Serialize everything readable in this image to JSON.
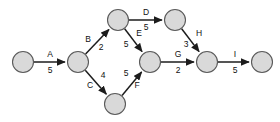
{
  "diagram": {
    "background_color": "#ffffff",
    "node_fill": "#d9d9d9",
    "node_stroke": "#5a5a5a",
    "edge_color": "#1c1c1c",
    "node_radius": 10.5,
    "nodes": [
      {
        "id": "n1",
        "cx": 23,
        "cy": 62,
        "label": ""
      },
      {
        "id": "n2",
        "cx": 78,
        "cy": 62,
        "label": ""
      },
      {
        "id": "n3",
        "cx": 118,
        "cy": 20,
        "label": ""
      },
      {
        "id": "n4",
        "cx": 175,
        "cy": 20,
        "label": ""
      },
      {
        "id": "n5",
        "cx": 115,
        "cy": 104,
        "label": ""
      },
      {
        "id": "n6",
        "cx": 150,
        "cy": 62,
        "label": ""
      },
      {
        "id": "n7",
        "cx": 207,
        "cy": 62,
        "label": ""
      },
      {
        "id": "n8",
        "cx": 262,
        "cy": 62,
        "label": ""
      }
    ],
    "edges": [
      {
        "name": "A",
        "weight": "5",
        "from": "n1",
        "to": "n2",
        "label_x": 50,
        "label_y": 55,
        "weight_x": 50,
        "weight_y": 71
      },
      {
        "name": "B",
        "weight": "2",
        "from": "n2",
        "to": "n3",
        "label_x": 88,
        "label_y": 40,
        "weight_x": 101,
        "weight_y": 48
      },
      {
        "name": "C",
        "weight": "4",
        "from": "n2",
        "to": "n5",
        "label_x": 90,
        "label_y": 86,
        "weight_x": 103,
        "weight_y": 76
      },
      {
        "name": "D",
        "weight": "5",
        "from": "n3",
        "to": "n4",
        "label_x": 146,
        "label_y": 13,
        "weight_x": 146,
        "weight_y": 28
      },
      {
        "name": "E",
        "weight": "5",
        "from": "n3",
        "to": "n6",
        "label_x": 139,
        "label_y": 34,
        "weight_x": 126,
        "weight_y": 45
      },
      {
        "name": "F",
        "weight": "5",
        "from": "n5",
        "to": "n6",
        "label_x": 137,
        "label_y": 86,
        "weight_x": 126,
        "weight_y": 74
      },
      {
        "name": "G",
        "weight": "2",
        "from": "n6",
        "to": "n7",
        "label_x": 178,
        "label_y": 55,
        "weight_x": 178,
        "weight_y": 71
      },
      {
        "name": "H",
        "weight": "3",
        "from": "n4",
        "to": "n7",
        "label_x": 199,
        "label_y": 34,
        "weight_x": 186,
        "weight_y": 45
      },
      {
        "name": "I",
        "weight": "5",
        "from": "n7",
        "to": "n8",
        "label_x": 235,
        "label_y": 55,
        "weight_x": 235,
        "weight_y": 71
      }
    ]
  }
}
